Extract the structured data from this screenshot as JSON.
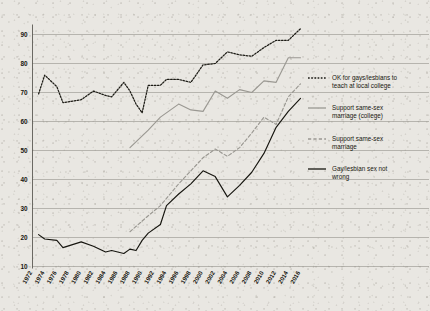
{
  "chart_data": {
    "type": "line",
    "title": "",
    "xlabel": "",
    "ylabel": "",
    "xlim": [
      1972,
      2016
    ],
    "ylim": [
      10,
      95
    ],
    "grid": true,
    "legend_position": "right",
    "y_ticks": [
      10,
      20,
      30,
      40,
      50,
      60,
      70,
      80,
      90
    ],
    "x_ticks": [
      1972,
      1974,
      1976,
      1978,
      1980,
      1982,
      1984,
      1986,
      1988,
      1990,
      1992,
      1994,
      1996,
      1998,
      2000,
      2002,
      2004,
      2006,
      2008,
      2010,
      2012,
      2014,
      2016
    ],
    "series": [
      {
        "name": "OK for gays/lesbians to teach at local college",
        "style": "dotted",
        "color": "#1d1c16",
        "x": [
          1973,
          1974,
          1976,
          1977,
          1980,
          1982,
          1984,
          1985,
          1987,
          1988,
          1989,
          1990,
          1991,
          1993,
          1994,
          1996,
          1998,
          2000,
          2002,
          2004,
          2006,
          2008,
          2010,
          2012,
          2014,
          2016
        ],
        "values": [
          69.5,
          76.0,
          72.0,
          66.5,
          67.5,
          70.5,
          69.0,
          68.5,
          73.5,
          70.5,
          66.0,
          63.0,
          72.5,
          72.5,
          74.5,
          74.5,
          73.5,
          79.5,
          80.0,
          84.0,
          83.0,
          82.5,
          85.5,
          88.0,
          88.0,
          92.0
        ]
      },
      {
        "name": "Support same-sex marriage (college)",
        "style": "solid",
        "color": "#9a9892",
        "x": [
          1988,
          1991,
          1993,
          1996,
          1998,
          2000,
          2002,
          2004,
          2006,
          2008,
          2010,
          2012,
          2014,
          2016
        ],
        "values": [
          51.0,
          57.0,
          61.5,
          66.0,
          64.0,
          63.5,
          70.5,
          68.0,
          71.0,
          70.0,
          74.0,
          73.5,
          82.0,
          82.0
        ]
      },
      {
        "name": "Support same-sex marriage",
        "style": "dashed",
        "color": "#9a9892",
        "x": [
          1988,
          1991,
          1993,
          1996,
          1998,
          2000,
          2002,
          2004,
          2006,
          2008,
          2010,
          2012,
          2014,
          2016
        ],
        "values": [
          22.0,
          27.5,
          31.0,
          38.5,
          43.0,
          47.5,
          50.5,
          48.0,
          51.0,
          56.0,
          61.5,
          59.0,
          68.5,
          73.0
        ]
      },
      {
        "name": "Gay/lesbian sex not wrong",
        "style": "solid",
        "color": "#16150f",
        "x": [
          1973,
          1974,
          1976,
          1977,
          1980,
          1982,
          1984,
          1985,
          1987,
          1988,
          1989,
          1990,
          1991,
          1993,
          1994,
          1996,
          1998,
          2000,
          2002,
          2004,
          2006,
          2008,
          2010,
          2012,
          2014,
          2016
        ],
        "values": [
          21.0,
          19.5,
          19.0,
          16.5,
          18.5,
          17.0,
          15.0,
          15.5,
          14.5,
          16.0,
          15.5,
          19.0,
          21.5,
          24.5,
          31.0,
          35.0,
          38.5,
          43.0,
          41.0,
          34.0,
          38.0,
          42.5,
          49.0,
          58.0,
          63.5,
          68.0
        ]
      }
    ]
  },
  "legend": {
    "items": [
      {
        "label_line1": "OK for gays/lesbians to",
        "label_line2": "teach at local college",
        "marker": "dotted-dark"
      },
      {
        "label_line1": "Support same-sex",
        "label_line2": "marriage (college)",
        "marker": "solid-gray"
      },
      {
        "label_line1": "Support same-sex",
        "label_line2": "marriage",
        "marker": "dashed-gray"
      },
      {
        "label_line1": "Gay/lesbian sex not",
        "label_line2": "wrong",
        "marker": "solid-dark"
      }
    ]
  },
  "colors": {
    "dark": "#16150f",
    "gray": "#9a9892",
    "grid": "#8b8a82",
    "paper": "#e9e7e2"
  }
}
